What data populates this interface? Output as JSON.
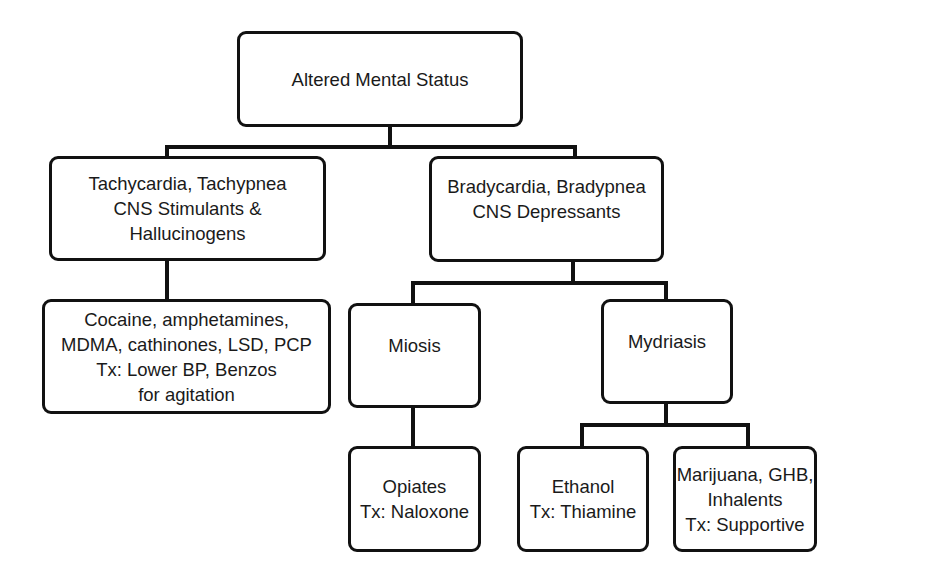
{
  "diagram": {
    "type": "flowchart",
    "nodes": {
      "root": {
        "label": "Altered Mental Status"
      },
      "stimulants": {
        "label": "Tachycardia, Tachypnea\nCNS Stimulants &\nHallucinogens"
      },
      "stimulant_agents": {
        "label": "Cocaine, amphetamines,\nMDMA, cathinones, LSD, PCP\nTx: Lower BP, Benzos\nfor agitation"
      },
      "depressants": {
        "label": "Bradycardia, Bradypnea\nCNS Depressants"
      },
      "miosis": {
        "label": "Miosis"
      },
      "opiates": {
        "label": "Opiates\nTx: Naloxone"
      },
      "mydriasis": {
        "label": "Mydriasis"
      },
      "ethanol": {
        "label": "Ethanol\nTx: Thiamine"
      },
      "other_depressants": {
        "label": "Marijuana, GHB,\nInhalents\nTx: Supportive"
      }
    },
    "edges": [
      [
        "root",
        "stimulants"
      ],
      [
        "root",
        "depressants"
      ],
      [
        "stimulants",
        "stimulant_agents"
      ],
      [
        "depressants",
        "miosis"
      ],
      [
        "depressants",
        "mydriasis"
      ],
      [
        "miosis",
        "opiates"
      ],
      [
        "mydriasis",
        "ethanol"
      ],
      [
        "mydriasis",
        "other_depressants"
      ]
    ]
  }
}
